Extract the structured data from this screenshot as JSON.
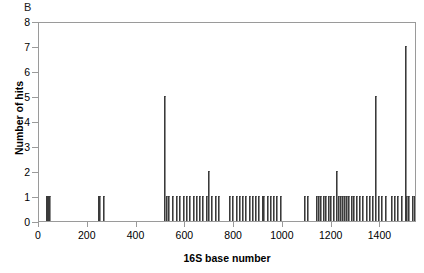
{
  "figure": {
    "panel_label": "B",
    "background": "#ffffff",
    "frame_color": "#9a9a9a",
    "bar_color": "#3a3a3a"
  },
  "chart_data": {
    "type": "bar",
    "title": "",
    "panel": "B",
    "xlabel": "16S base number",
    "ylabel": "Number of hits",
    "xlim": [
      0,
      1550
    ],
    "ylim": [
      0,
      8
    ],
    "grid": false,
    "legend": null,
    "xticks": [
      0,
      200,
      400,
      600,
      800,
      1000,
      1200,
      1400
    ],
    "yticks": [
      0,
      1,
      2,
      3,
      4,
      5,
      6,
      7,
      8
    ],
    "x": [
      33,
      38,
      42,
      47,
      249,
      254,
      268,
      519,
      527,
      534,
      552,
      566,
      580,
      595,
      607,
      620,
      636,
      650,
      663,
      676,
      690,
      700,
      712,
      728,
      742,
      786,
      798,
      812,
      826,
      840,
      852,
      866,
      879,
      892,
      905,
      919,
      926,
      940,
      953,
      966,
      980,
      994,
      1092,
      1105,
      1140,
      1152,
      1160,
      1172,
      1180,
      1190,
      1198,
      1210,
      1222,
      1232,
      1240,
      1248,
      1256,
      1266,
      1274,
      1286,
      1295,
      1308,
      1320,
      1332,
      1345,
      1358,
      1372,
      1382,
      1396,
      1410,
      1424,
      1448,
      1462,
      1476,
      1490,
      1505,
      1512,
      1520,
      1534,
      1543
    ],
    "values": [
      1,
      1,
      1,
      1,
      1,
      1,
      1,
      5,
      1,
      1,
      1,
      1,
      1,
      1,
      1,
      1,
      1,
      1,
      1,
      1,
      1,
      2,
      1,
      1,
      1,
      1,
      1,
      1,
      1,
      1,
      1,
      1,
      1,
      1,
      1,
      1,
      1,
      1,
      1,
      1,
      1,
      1,
      1,
      1,
      1,
      1,
      1,
      1,
      1,
      1,
      1,
      1,
      2,
      1,
      1,
      1,
      1,
      1,
      1,
      1,
      1,
      1,
      1,
      1,
      1,
      1,
      1,
      5,
      1,
      1,
      1,
      1,
      1,
      1,
      1,
      7,
      1,
      1,
      1,
      1
    ]
  }
}
